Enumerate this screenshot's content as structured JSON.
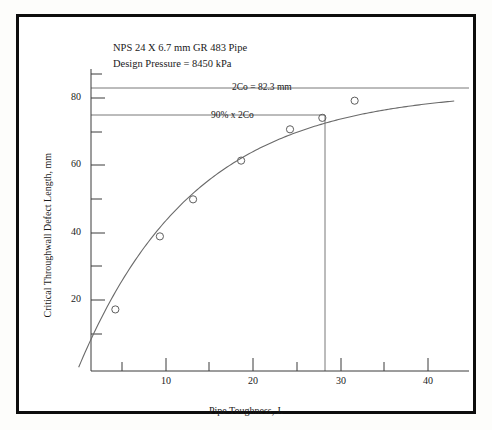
{
  "figure": {
    "annotations": {
      "pipe_spec": "NPS 24 X 6.7 mm GR 483 Pipe",
      "design_pressure": "Design Pressure = 8450 kPa",
      "full_2co": "2Co = 82.3 mm",
      "ninety_percent": "90% x 2Co"
    }
  },
  "chart_data": {
    "type": "scatter",
    "title": "",
    "xlabel": "Pipe Toughness, J.",
    "ylabel": "Critical Throughwall Defect Length, mm",
    "xlim": [
      0,
      43
    ],
    "ylim": [
      0,
      88
    ],
    "xticks": [
      10,
      20,
      30,
      40
    ],
    "xtick_labels": [
      "10",
      "20",
      "30",
      "40"
    ],
    "yticks": [
      20,
      40,
      60,
      80
    ],
    "ytick_labels": [
      "20",
      "40",
      "60",
      "80"
    ],
    "x_minor_ticks": [
      5,
      15,
      25,
      35
    ],
    "y_minor_ticks": [
      10,
      30,
      50,
      70
    ],
    "grid": false,
    "legend": "none",
    "marker": "open-circle",
    "series": [
      {
        "name": "Critical throughwall defect length",
        "x": [
          4.2,
          9.3,
          13.1,
          18.6,
          24.2,
          27.9,
          31.6
        ],
        "y": [
          17.2,
          38.9,
          49.9,
          61.4,
          70.7,
          74.1,
          79.2
        ]
      }
    ],
    "fitted_curve": {
      "description": "Saturating curve approaching 2Co asymptote",
      "asymptote": 82.3
    },
    "reference_lines": [
      {
        "name": "2Co",
        "type": "horizontal",
        "value": 82.3,
        "label": "2Co = 82.3 mm"
      },
      {
        "name": "90% x 2Co",
        "type": "horizontal",
        "value": 74.07,
        "label": "90% x 2Co"
      },
      {
        "name": "toughness-at-90pct",
        "type": "vertical",
        "value": 27.9,
        "label": ""
      }
    ]
  }
}
